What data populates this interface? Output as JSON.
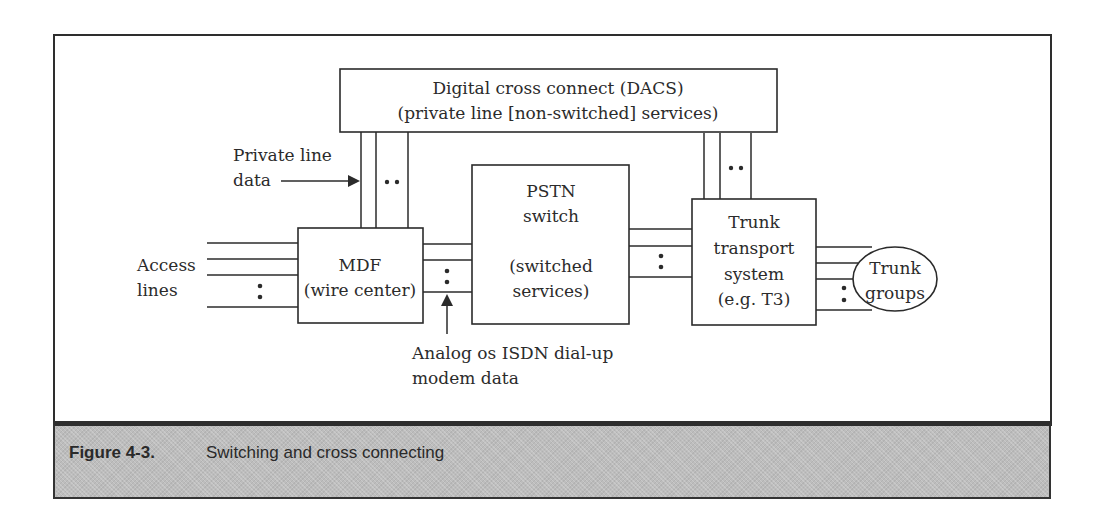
{
  "figure": {
    "number": "Figure 4-3.",
    "caption": "Switching and cross connecting"
  },
  "nodes": {
    "dacs": {
      "line1": "Digital cross connect (DACS)",
      "line2": "(private line [non-switched] services)"
    },
    "mdf": {
      "line1": "MDF",
      "line2": "(wire center)"
    },
    "pstn": {
      "line1": "PSTN",
      "line2": "switch",
      "line3": "(switched",
      "line4": "services)"
    },
    "trunk_transport": {
      "line1": "Trunk",
      "line2": "transport",
      "line3": "system",
      "line4": "(e.g. T3)"
    },
    "trunk_groups": {
      "line1": "Trunk",
      "line2": "groups"
    }
  },
  "labels": {
    "access_lines": {
      "line1": "Access",
      "line2": "lines"
    },
    "private_line_data": {
      "line1": "Private line",
      "line2": "data"
    },
    "analog_isdn": {
      "line1": "Analog os ISDN dial-up",
      "line2": "modem data"
    }
  },
  "colors": {
    "line": "#2b2b2b",
    "caption_band": "#bdbdbd",
    "background": "#ffffff"
  }
}
